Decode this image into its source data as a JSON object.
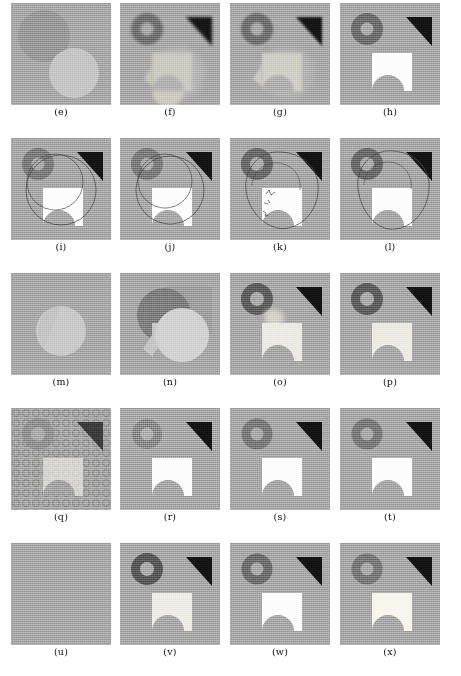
{
  "figure": {
    "columns": 4,
    "rows": 5,
    "panel_size_px": [
      100,
      102
    ],
    "background": "#ffffff"
  },
  "palette": {
    "page_background": "#ffffff",
    "panel_gray": "#a9a9a9",
    "panel_gray_light": "#b3b3b3",
    "dark_gray_circle": "#8a8a8a",
    "ring_gray": "#7d7d7d",
    "ring_dark": "#5f5f5f",
    "ring_hole": "#ababab",
    "triangle_black": "#141414",
    "square_white": "#fdfdfd",
    "square_light": "#d8d8d8",
    "light_circle": "#cfcfcf",
    "contour_line": "#4c4c4c",
    "texture_ring": "#9a9a9a",
    "caption_text": "#111111"
  },
  "rows": [
    {
      "index": 0,
      "panels": [
        {
          "caption": "(e)",
          "name": "panel-e",
          "kind": "two-circles",
          "description": "Low-contrast input: one darker gray disc upper-left, one lighter gray disc lower-right"
        },
        {
          "caption": "(f)",
          "name": "panel-f",
          "kind": "blurry-result",
          "description": "Ring, black triangle, blurred light blob with faint disc"
        },
        {
          "caption": "(g)",
          "name": "panel-g",
          "kind": "blurry-result",
          "description": "Ring, black triangle, blurred light blob with faint disc"
        },
        {
          "caption": "(h)",
          "name": "panel-h",
          "kind": "clean-result",
          "description": "Ring, black triangle, crisp white notched square"
        }
      ]
    },
    {
      "index": 1,
      "panels": [
        {
          "caption": "(i)",
          "name": "panel-i",
          "kind": "contour-circle",
          "description": "Clean shapes with a large smooth circular contour overlay"
        },
        {
          "caption": "(j)",
          "name": "panel-j",
          "kind": "contour-circle",
          "description": "Clean shapes with a large smooth circular contour overlay"
        },
        {
          "caption": "(k)",
          "name": "panel-k",
          "kind": "contour-irregular",
          "description": "Clean shapes with an irregular wavy contour overlay and stray squiggles"
        },
        {
          "caption": "(l)",
          "name": "panel-l",
          "kind": "contour-irregular",
          "description": "Clean shapes with an irregular wavy contour overlay"
        }
      ]
    },
    {
      "index": 2,
      "panels": [
        {
          "caption": "(m)",
          "name": "panel-m",
          "kind": "single-circle",
          "description": "Uniform gray field with a single light disc near the centre"
        },
        {
          "caption": "(n)",
          "name": "panel-n",
          "kind": "overlap",
          "description": "Dark disc, gray square region and a light disc overlapping the notched square"
        },
        {
          "caption": "(o)",
          "name": "panel-o",
          "kind": "partial-result",
          "description": "Ring, black triangle, light notched square with a soft halo above it"
        },
        {
          "caption": "(p)",
          "name": "panel-p",
          "kind": "clean-result",
          "description": "Ring, black triangle, light notched square"
        }
      ]
    },
    {
      "index": 3,
      "panels": [
        {
          "caption": "(q)",
          "name": "panel-q",
          "kind": "textured",
          "description": "Periodic texture of small rings covering the whole panel behind the shapes"
        },
        {
          "caption": "(r)",
          "name": "panel-r",
          "kind": "clean-result",
          "description": "Ring, black triangle, white notched square on noisy background"
        },
        {
          "caption": "(s)",
          "name": "panel-s",
          "kind": "clean-result",
          "description": "Ring, black triangle, white notched square"
        },
        {
          "caption": "(t)",
          "name": "panel-t",
          "kind": "clean-result",
          "description": "Ring, black triangle, white notched square"
        }
      ]
    },
    {
      "index": 4,
      "panels": [
        {
          "caption": "(u)",
          "name": "panel-u",
          "kind": "blank",
          "description": "Uniform flat gray panel with no shapes"
        },
        {
          "caption": "(v)",
          "name": "panel-v",
          "kind": "clean-result",
          "description": "Dark ring, black triangle, light notched square"
        },
        {
          "caption": "(w)",
          "name": "panel-w",
          "kind": "clean-result",
          "description": "Ring, black triangle, white notched square"
        },
        {
          "caption": "(x)",
          "name": "panel-x",
          "kind": "clean-result",
          "description": "Ring, black triangle, white notched square"
        }
      ]
    }
  ]
}
